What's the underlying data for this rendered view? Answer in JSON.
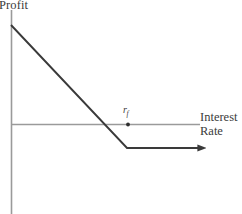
{
  "figure": {
    "axis_color": "#9a9a9a",
    "curve_color": "#3a3a3a",
    "background": "#ffffff",
    "y_axis_label": "Profit",
    "x_axis_label_line1": "Interest",
    "x_axis_label_line2": "Rate",
    "breakeven_symbol": "r",
    "breakeven_subscript": "f"
  },
  "chart_data": {
    "type": "line",
    "title": "",
    "xlabel": "Interest Rate",
    "ylabel": "Profit",
    "grid": false,
    "legend": null,
    "axis_origin": {
      "x": 11,
      "y": 124
    },
    "xlim": [
      0,
      200
    ],
    "ylim": [
      -90,
      99
    ],
    "annotations": [
      {
        "label": "r_f",
        "display": "r",
        "subscript": "f",
        "x": 128,
        "y": 124,
        "marker": "dot",
        "note": "risk-free rate marker on interest rate axis"
      }
    ],
    "series": [
      {
        "name": "Profit",
        "points": [
          {
            "x": 11,
            "y": 25
          },
          {
            "x": 127,
            "y": 148
          },
          {
            "x": 203,
            "y": 148
          }
        ],
        "arrow_end": true,
        "color": "#3a3a3a"
      }
    ]
  }
}
